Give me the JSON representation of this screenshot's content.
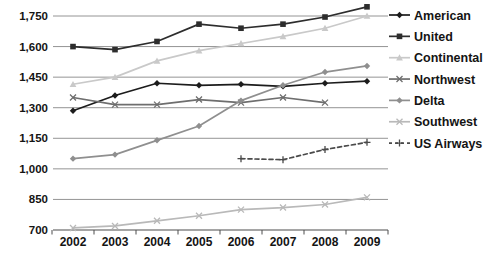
{
  "chart_data": {
    "type": "line",
    "title": "",
    "xlabel": "",
    "ylabel": "",
    "x": [
      "2002",
      "2003",
      "2004",
      "2005",
      "2006",
      "2007",
      "2008",
      "2009"
    ],
    "ylim": [
      700,
      1750
    ],
    "ytick_step": 150,
    "yticks": [
      {
        "value": 700,
        "label": "700"
      },
      {
        "value": 850,
        "label": "850"
      },
      {
        "value": 1000,
        "label": "1,000"
      },
      {
        "value": 1150,
        "label": "1,150"
      },
      {
        "value": 1300,
        "label": "1,300"
      },
      {
        "value": 1450,
        "label": "1,450"
      },
      {
        "value": 1600,
        "label": "1,600"
      },
      {
        "value": 1750,
        "label": "1,750"
      }
    ],
    "grid": true,
    "legend_position": "right",
    "series": [
      {
        "name": "American",
        "values": [
          1285,
          1360,
          1420,
          1410,
          1415,
          1405,
          1420,
          1430
        ],
        "color": "#1c1c1c",
        "marker": "diamond",
        "dash": "solid"
      },
      {
        "name": "United",
        "values": [
          1600,
          1585,
          1625,
          1710,
          1690,
          1710,
          1745,
          1795
        ],
        "color": "#2d2d2d",
        "marker": "square",
        "dash": "solid"
      },
      {
        "name": "Continental",
        "values": [
          1415,
          1450,
          1530,
          1580,
          1615,
          1650,
          1690,
          1750
        ],
        "color": "#c9c9c9",
        "marker": "triangle",
        "dash": "solid"
      },
      {
        "name": "Northwest",
        "values": [
          1350,
          1315,
          1315,
          1340,
          1325,
          1350,
          1325,
          null
        ],
        "color": "#6e6e6e",
        "marker": "x",
        "dash": "solid"
      },
      {
        "name": "Delta",
        "values": [
          1050,
          1070,
          1140,
          1210,
          1335,
          1410,
          1475,
          1505
        ],
        "color": "#8f8f8f",
        "marker": "diamond",
        "dash": "solid"
      },
      {
        "name": "Southwest",
        "values": [
          710,
          720,
          745,
          770,
          800,
          810,
          825,
          860
        ],
        "color": "#b9b9b9",
        "marker": "x",
        "dash": "solid"
      },
      {
        "name": "US Airways",
        "values": [
          null,
          null,
          null,
          null,
          1050,
          1045,
          1095,
          1130
        ],
        "color": "#4a4a4a",
        "marker": "plus",
        "dash": "dashed"
      }
    ],
    "colors": {
      "gridline": "#949494",
      "axis": "#4d4d4d",
      "label_text": "#141414",
      "background": "#ffffff"
    }
  }
}
